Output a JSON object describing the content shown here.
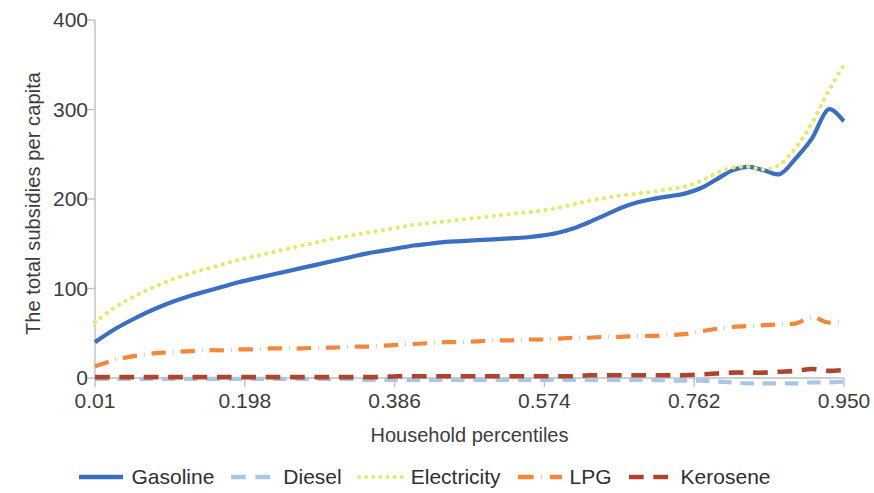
{
  "chart_data": {
    "type": "line",
    "title": "",
    "xlabel": "Household percentiles",
    "ylabel": "The total subsidies per capita",
    "xlim": [
      0.01,
      0.95
    ],
    "ylim": [
      0,
      400
    ],
    "grid": false,
    "legend_position": "bottom",
    "xticks": [
      "0.01",
      "0.198",
      "0.386",
      "0.574",
      "0.762",
      "0.950"
    ],
    "xtick_values": [
      0.01,
      0.198,
      0.386,
      0.574,
      0.762,
      0.95
    ],
    "yticks": [
      "0",
      "100",
      "200",
      "300",
      "400"
    ],
    "ytick_values": [
      0,
      100,
      200,
      300,
      400
    ],
    "x": [
      0.01,
      0.03,
      0.05,
      0.07,
      0.09,
      0.11,
      0.13,
      0.15,
      0.17,
      0.19,
      0.21,
      0.23,
      0.25,
      0.27,
      0.29,
      0.31,
      0.33,
      0.35,
      0.37,
      0.39,
      0.41,
      0.43,
      0.45,
      0.47,
      0.49,
      0.51,
      0.53,
      0.55,
      0.57,
      0.59,
      0.61,
      0.63,
      0.65,
      0.67,
      0.69,
      0.71,
      0.73,
      0.75,
      0.77,
      0.79,
      0.81,
      0.83,
      0.85,
      0.87,
      0.89,
      0.91,
      0.93,
      0.95
    ],
    "series": [
      {
        "name": "Gasoline",
        "color": "#3a6fc4",
        "style": "solid",
        "width": 4.2,
        "values": [
          40,
          52,
          62,
          71,
          79,
          86,
          92,
          97,
          102,
          107,
          111,
          115,
          119,
          123,
          127,
          131,
          135,
          139,
          142,
          145,
          148,
          150,
          152,
          153,
          154,
          155,
          156,
          157,
          159,
          162,
          167,
          174,
          182,
          190,
          196,
          200,
          203,
          206,
          212,
          222,
          232,
          236,
          232,
          228,
          246,
          268,
          300,
          287
        ]
      },
      {
        "name": "Diesel",
        "color": "#a9c6e8",
        "style": "dashed",
        "width": 4.2,
        "values": [
          -1,
          -1,
          -1,
          -1,
          -1,
          -1,
          -1,
          -1,
          -1,
          -1,
          -1,
          -1,
          -1,
          -1,
          -1,
          -1,
          -1,
          -2,
          -2,
          -2,
          -2,
          -2,
          -2,
          -2,
          -2,
          -2,
          -2,
          -2,
          -2,
          -2,
          -2,
          -2,
          -2,
          -2,
          -2,
          -2,
          -3,
          -3,
          -3,
          -4,
          -5,
          -6,
          -6,
          -6,
          -6,
          -5,
          -5,
          -4
        ]
      },
      {
        "name": "Electricity",
        "color": "#e8e86a",
        "style": "dotted",
        "width": 4.2,
        "values": [
          62,
          76,
          87,
          96,
          104,
          111,
          117,
          122,
          127,
          132,
          136,
          140,
          144,
          148,
          152,
          156,
          159,
          162,
          165,
          168,
          171,
          173,
          175,
          177,
          179,
          181,
          183,
          185,
          187,
          190,
          194,
          198,
          201,
          204,
          206,
          208,
          211,
          214,
          220,
          229,
          235,
          236,
          233,
          239,
          258,
          285,
          320,
          350
        ]
      },
      {
        "name": "LPG",
        "color": "#f5873a",
        "style": "dashdot",
        "width": 4.2,
        "values": [
          13,
          19,
          23,
          26,
          28,
          29,
          30,
          31,
          31,
          32,
          32,
          33,
          33,
          33,
          34,
          34,
          35,
          35,
          36,
          37,
          38,
          39,
          40,
          40,
          41,
          42,
          42,
          43,
          43,
          44,
          45,
          45,
          46,
          46,
          47,
          47,
          48,
          49,
          52,
          55,
          57,
          58,
          59,
          60,
          61,
          68,
          62,
          64
        ]
      },
      {
        "name": "Kerosene",
        "color": "#b0432b",
        "style": "dashed",
        "width": 4.6,
        "values": [
          1,
          1,
          1,
          1,
          1,
          1,
          1,
          1,
          1,
          1,
          1,
          1,
          1,
          1,
          1,
          1,
          1,
          1,
          1,
          2,
          2,
          2,
          2,
          2,
          2,
          2,
          2,
          2,
          2,
          2,
          2,
          3,
          3,
          3,
          3,
          3,
          3,
          3,
          4,
          5,
          6,
          6,
          6,
          7,
          8,
          10,
          8,
          9
        ]
      }
    ]
  },
  "legend": {
    "items": [
      {
        "label": "Gasoline"
      },
      {
        "label": "Diesel"
      },
      {
        "label": "Electricity"
      },
      {
        "label": "LPG"
      },
      {
        "label": "Kerosene"
      }
    ]
  },
  "axes": {
    "y_title": "The total subsidies per capita",
    "x_title": "Household percentiles"
  }
}
